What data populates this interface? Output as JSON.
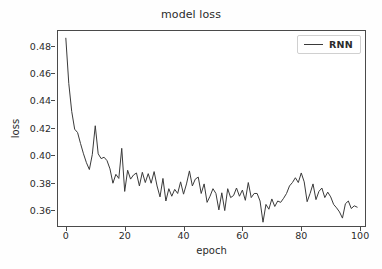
{
  "chart_data": {
    "type": "line",
    "title": "model loss",
    "xlabel": "epoch",
    "ylabel": "loss",
    "xlim": [
      -3,
      102
    ],
    "ylim": [
      0.3475,
      0.4915
    ],
    "grid": false,
    "legend_position": "upper right",
    "xticks": [
      0,
      20,
      40,
      60,
      80,
      100
    ],
    "xtick_labels": [
      "0",
      "20",
      "40",
      "60",
      "80",
      "100"
    ],
    "yticks": [
      0.36,
      0.38,
      0.4,
      0.42,
      0.44,
      0.46,
      0.48
    ],
    "ytick_labels": [
      "0.36",
      "0.38",
      "0.40",
      "0.42",
      "0.44",
      "0.46",
      "0.48"
    ],
    "series": [
      {
        "name": "RNN",
        "color": "#3a3a3a",
        "x": [
          0,
          1,
          2,
          3,
          4,
          5,
          6,
          7,
          8,
          9,
          10,
          11,
          12,
          13,
          14,
          15,
          16,
          17,
          18,
          19,
          20,
          21,
          22,
          23,
          24,
          25,
          26,
          27,
          28,
          29,
          30,
          31,
          32,
          33,
          34,
          35,
          36,
          37,
          38,
          39,
          40,
          41,
          42,
          43,
          44,
          45,
          46,
          47,
          48,
          49,
          50,
          51,
          52,
          53,
          54,
          55,
          56,
          57,
          58,
          59,
          60,
          61,
          62,
          63,
          64,
          65,
          66,
          67,
          68,
          69,
          70,
          71,
          72,
          73,
          74,
          75,
          76,
          77,
          78,
          79,
          80,
          81,
          82,
          83,
          84,
          85,
          86,
          87,
          88,
          89,
          90,
          91,
          92,
          93,
          94,
          95,
          96,
          97,
          98,
          99
        ],
        "values": [
          0.4855,
          0.4525,
          0.432,
          0.419,
          0.4165,
          0.4085,
          0.401,
          0.3945,
          0.3895,
          0.4005,
          0.4215,
          0.401,
          0.3975,
          0.3985,
          0.396,
          0.39,
          0.3795,
          0.386,
          0.383,
          0.405,
          0.3735,
          0.389,
          0.3825,
          0.3855,
          0.387,
          0.3775,
          0.3875,
          0.38,
          0.3865,
          0.3795,
          0.388,
          0.3775,
          0.3695,
          0.383,
          0.3665,
          0.3755,
          0.37,
          0.375,
          0.372,
          0.3805,
          0.3715,
          0.379,
          0.3885,
          0.3775,
          0.3825,
          0.384,
          0.372,
          0.379,
          0.3655,
          0.37,
          0.3755,
          0.372,
          0.36,
          0.3725,
          0.3595,
          0.3755,
          0.369,
          0.3705,
          0.376,
          0.37,
          0.3745,
          0.367,
          0.38,
          0.369,
          0.372,
          0.372,
          0.3665,
          0.351,
          0.364,
          0.3605,
          0.368,
          0.3625,
          0.3665,
          0.3655,
          0.3685,
          0.372,
          0.3775,
          0.38,
          0.3835,
          0.38,
          0.387,
          0.3805,
          0.366,
          0.372,
          0.379,
          0.3675,
          0.3735,
          0.376,
          0.369,
          0.373,
          0.3695,
          0.364,
          0.3615,
          0.3585,
          0.354,
          0.3645,
          0.3665,
          0.361,
          0.363,
          0.362
        ]
      }
    ]
  },
  "legend": {
    "entries": [
      {
        "label": "RNN"
      }
    ]
  }
}
